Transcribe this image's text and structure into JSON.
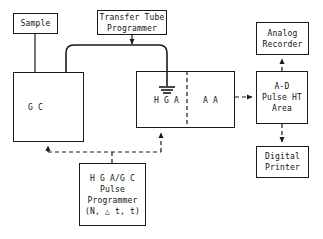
{
  "diagram": {
    "stroke_color": "#1a1a1a",
    "background_color": "#ffffff",
    "nodes": {
      "sample": {
        "label": "Sample"
      },
      "transfer_tube_programmer": {
        "line1": "Transfer Tube",
        "line2": "Programmer"
      },
      "gc": {
        "label": "G C"
      },
      "hga_aa": {
        "hga_label": "H G A",
        "aa_label": "A A"
      },
      "ad_pulse": {
        "line1": "A-D",
        "line2": "Pulse HT",
        "line3": "Area"
      },
      "analog_recorder": {
        "line1": "Analog",
        "line2": "Recorder"
      },
      "digital_printer": {
        "line1": "Digital",
        "line2": "Printer"
      },
      "hga_gc_pulse_programmer": {
        "line1": "H G A/G C",
        "line2": "Pulse",
        "line3": "Programmer",
        "line4": "(N, △ t, t)"
      }
    },
    "connectors": {
      "sample_to_gc": {
        "style": "solid",
        "arrow": false
      },
      "transfer_tube": {
        "style": "solid",
        "arrow": false,
        "shape": "rounded-bridge"
      },
      "ttp_to_transfer_tube": {
        "style": "solid",
        "arrow": true
      },
      "hga_ground": {
        "style": "solid",
        "symbol": "ground-icon"
      },
      "aa_to_ad": {
        "style": "dashed",
        "arrow": true
      },
      "ad_to_analog_recorder": {
        "style": "dashed",
        "arrow": true
      },
      "ad_to_digital_printer": {
        "style": "dashed",
        "arrow": true
      },
      "programmer_to_gc": {
        "style": "dashed",
        "arrow": true
      },
      "programmer_to_hga": {
        "style": "dashed",
        "arrow": true
      }
    }
  }
}
